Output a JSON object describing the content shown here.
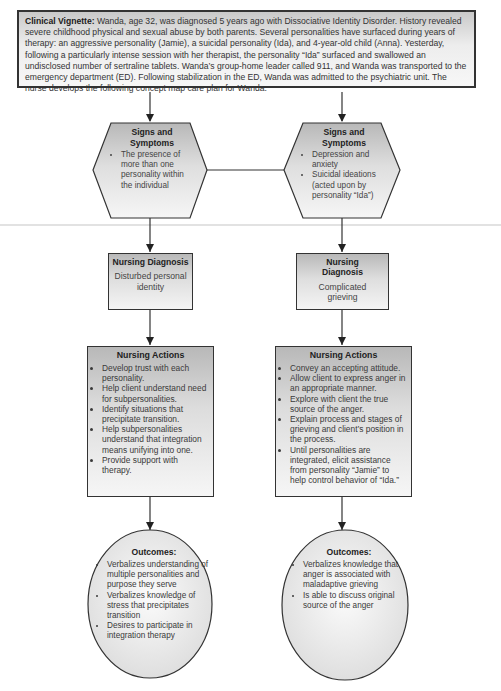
{
  "vignette": {
    "label": "Clinical Vignette:",
    "text": " Wanda, age 32, was diagnosed 5 years ago with Dissociative Identity Disorder. History revealed severe childhood physical and sexual abuse by both parents. Several personalities have surfaced during years of therapy: an aggressive personality (Jamie), a suicidal personality (Ida), and 4-year-old child (Anna). Yesterday, following a particularly intense session with her therapist, the personality “Ida” surfaced and swallowed an undisclosed number of sertraline tablets. Wanda’s group-home leader called 911, and Wanda was transported to the emergency department (ED). Following stabilization in the ED, Wanda was admitted to the psychiatric unit. The nurse develops the following concept map care plan for Wanda."
  },
  "left": {
    "signs": {
      "title": "Signs and Symptoms",
      "items": [
        "The presence of more than one personality within the individual"
      ]
    },
    "diagnosis": {
      "title": "Nursing Diagnosis",
      "value": "Disturbed personal identity"
    },
    "actions": {
      "title": "Nursing Actions",
      "items": [
        "Develop trust with each personality.",
        "Help client understand need for subpersonalities.",
        "Identify situations that precipitate transition.",
        "Help subpersonalities understand that integration means unifying into one.",
        "Provide support with therapy."
      ]
    },
    "outcomes": {
      "title": "Outcomes:",
      "items": [
        "Verbalizes understanding of multiple personalities and purpose they serve",
        "Verbalizes knowledge of stress that precipitates transition",
        "Desires to participate in integration therapy"
      ]
    }
  },
  "right": {
    "signs": {
      "title": "Signs and Symptoms",
      "items": [
        "Depression and anxiety",
        "Suicidal ideations (acted upon by personality “Ida”)"
      ]
    },
    "diagnosis": {
      "title": "Nursing Diagnosis",
      "value": "Complicated grieving"
    },
    "actions": {
      "title": "Nursing Actions",
      "items": [
        "Convey an accepting attitude.",
        "Allow client to express anger in an appropriate manner.",
        "Explore with client the true source of the anger.",
        "Explain process and stages of grieving and client’s position in the process.",
        "Until personalities are integrated, elicit assistance from personality “Jamie” to help control behavior of “Ida.”"
      ]
    },
    "outcomes": {
      "title": "Outcomes:",
      "items": [
        "Verbalizes knowledge that anger is associated with maladaptive grieving",
        "Is able to discuss original source of the anger"
      ]
    }
  },
  "colors": {
    "stroke": "#333333",
    "shape_dark": "#b8b8b8",
    "shape_light": "#f4f4f4",
    "oval_fill": "#ececec"
  }
}
